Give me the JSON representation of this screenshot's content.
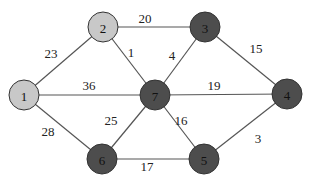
{
  "diagram": {
    "type": "weighted-undirected-graph",
    "colors": {
      "light_node": "#c8c8c8",
      "dark_node": "#4d4d4d",
      "edge": "#555555",
      "background": "#ffffff"
    },
    "nodes": [
      {
        "id": "1",
        "label": "1",
        "x": 24,
        "y": 95,
        "shade": "light"
      },
      {
        "id": "2",
        "label": "2",
        "x": 103,
        "y": 27,
        "shade": "light"
      },
      {
        "id": "3",
        "label": "3",
        "x": 205,
        "y": 27,
        "shade": "dark"
      },
      {
        "id": "4",
        "label": "4",
        "x": 287,
        "y": 94,
        "shade": "dark"
      },
      {
        "id": "5",
        "label": "5",
        "x": 204,
        "y": 159,
        "shade": "dark"
      },
      {
        "id": "6",
        "label": "6",
        "x": 102,
        "y": 159,
        "shade": "dark"
      },
      {
        "id": "7",
        "label": "7",
        "x": 155,
        "y": 95,
        "shade": "dark"
      }
    ],
    "edges": [
      {
        "from": "1",
        "to": "2",
        "weight": "23",
        "lx": 51,
        "ly": 58
      },
      {
        "from": "1",
        "to": "7",
        "weight": "36",
        "lx": 89,
        "ly": 90
      },
      {
        "from": "1",
        "to": "6",
        "weight": "28",
        "lx": 48,
        "ly": 136
      },
      {
        "from": "2",
        "to": "3",
        "weight": "20",
        "lx": 145,
        "ly": 23
      },
      {
        "from": "2",
        "to": "7",
        "weight": "1",
        "lx": 131,
        "ly": 57
      },
      {
        "from": "3",
        "to": "7",
        "weight": "4",
        "lx": 172,
        "ly": 60
      },
      {
        "from": "3",
        "to": "4",
        "weight": "15",
        "lx": 256,
        "ly": 53
      },
      {
        "from": "7",
        "to": "4",
        "weight": "19",
        "lx": 214,
        "ly": 90
      },
      {
        "from": "7",
        "to": "6",
        "weight": "25",
        "lx": 111,
        "ly": 125
      },
      {
        "from": "7",
        "to": "5",
        "weight": "16",
        "lx": 181,
        "ly": 125
      },
      {
        "from": "6",
        "to": "5",
        "weight": "17",
        "lx": 147,
        "ly": 171
      },
      {
        "from": "5",
        "to": "4",
        "weight": "3",
        "lx": 258,
        "ly": 143
      }
    ]
  }
}
